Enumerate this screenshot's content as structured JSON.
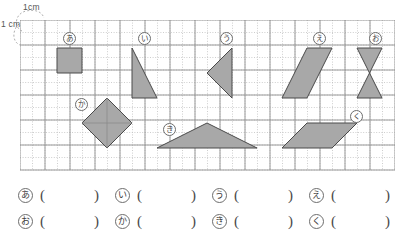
{
  "worksheet": {
    "title": "Area of figures on 1 cm grid",
    "background_color": "#ffffff"
  },
  "scale_annotation": {
    "top_label": "1cm",
    "left_label": "1 cm",
    "description": "one grid square equals 1 cm by 1 cm"
  },
  "grid": {
    "cell_px": 25,
    "cols": 15,
    "rows": 6,
    "major_line_color": "#8f8f8f",
    "minor_line_color": "#b9b9b9",
    "minor_line_style": "dotted",
    "minor_divisions": 2
  },
  "shape_style": {
    "fill": "#a8a8a8",
    "stroke": "#4a4a4a"
  },
  "shapes": [
    {
      "key": "あ",
      "name": "square",
      "label_x": 43,
      "label_y": 12,
      "points": "37,28 62,28 62,53 37,53"
    },
    {
      "key": "い",
      "name": "right-triangle",
      "label_x": 118,
      "label_y": 12,
      "points": "112,28 112,78 137,78"
    },
    {
      "key": "う",
      "name": "left-pointing-triangle",
      "label_x": 200,
      "label_y": 12,
      "points": "212,28 212,78 187,53"
    },
    {
      "key": "え",
      "name": "parallelogram",
      "label_x": 293,
      "label_y": 12,
      "points": "287,28 312,28 287,78 262,78"
    },
    {
      "key": "お",
      "name": "hourglass-bowtie",
      "label_x": 349,
      "label_y": 12,
      "points": "337,28 362,28 337,78 362,78"
    },
    {
      "key": "か",
      "name": "diamond-rhombus",
      "label_x": 55,
      "label_y": 78,
      "points": "87,78 112,103 87,128 62,103"
    },
    {
      "key": "き",
      "name": "wide-flat-triangle",
      "label_x": 143,
      "label_y": 103,
      "points": "187,103 237,128 137,128"
    },
    {
      "key": "く",
      "name": "thin-slanted-parallelogram",
      "label_x": 330,
      "label_y": 90,
      "points": "287,103 337,103 312,128 262,128"
    }
  ],
  "answers": {
    "rows": [
      [
        {
          "key": "あ",
          "value": ""
        },
        {
          "key": "い",
          "value": ""
        },
        {
          "key": "う",
          "value": ""
        },
        {
          "key": "え",
          "value": ""
        }
      ],
      [
        {
          "key": "お",
          "value": ""
        },
        {
          "key": "か",
          "value": ""
        },
        {
          "key": "き",
          "value": ""
        },
        {
          "key": "く",
          "value": ""
        }
      ]
    ],
    "open_paren": "(",
    "close_paren": ")"
  }
}
